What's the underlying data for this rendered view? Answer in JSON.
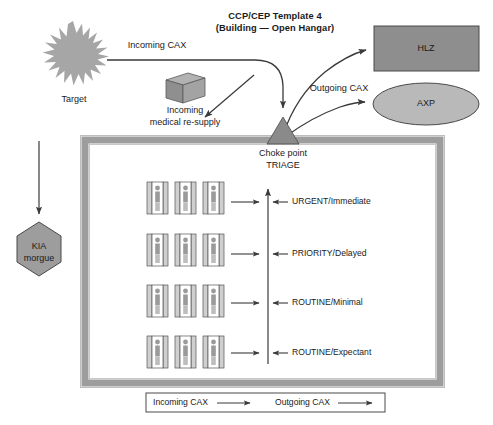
{
  "title": {
    "line1": "CCP/CEP Template 4",
    "line2": "(Building — Open Hangar)"
  },
  "nodes": {
    "target": "Target",
    "resupply_line1": "Incoming",
    "resupply_line2": "medical re-supply",
    "kia_line1": "KIA",
    "kia_line2": "morgue",
    "hlz": "HLZ",
    "axp": "AXP",
    "choke_line1": "Choke point",
    "choke_line2": "TRIAGE"
  },
  "flows": {
    "incoming": "Incoming CAX",
    "outgoing": "Outgoing CAX"
  },
  "triage_categories": [
    "URGENT/Immediate",
    "PRIORITY/Delayed",
    "ROUTINE/Minimal",
    "ROUTINE/Expectant"
  ],
  "legend": {
    "incoming": "Incoming CAX",
    "outgoing": "Outgoing CAX"
  },
  "colors": {
    "shape_fill": "#9a9a9a",
    "shape_fill_light": "#b8b8b8",
    "hlz_fill": "#8e8e8e",
    "wall": "#9d9d9d",
    "line": "#3a3a3a",
    "text": "#1a1a1a"
  }
}
